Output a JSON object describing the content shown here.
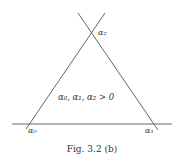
{
  "figure": {
    "caption": "Fig. 3.2 (b)",
    "condition_label": "α₀, α₁, α₂ > 0",
    "vertex_labels": {
      "top": "α₂",
      "left": "α₀",
      "right": "α₁"
    },
    "line_color": "#444444"
  }
}
